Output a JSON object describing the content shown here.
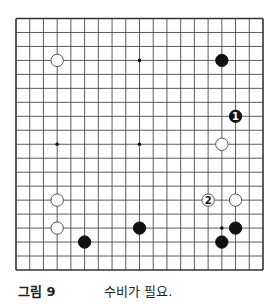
{
  "diagram": {
    "type": "go-board",
    "size": 19,
    "colors": {
      "line": "#333333",
      "black": "#111111",
      "white": "#ffffff",
      "background": "#ffffff"
    },
    "star_points": [
      [
        3,
        3
      ],
      [
        9,
        3
      ],
      [
        15,
        3
      ],
      [
        3,
        9
      ],
      [
        9,
        9
      ],
      [
        15,
        9
      ],
      [
        3,
        15
      ],
      [
        9,
        15
      ],
      [
        15,
        15
      ]
    ],
    "stones": [
      {
        "col": 3,
        "row": 3,
        "color": "white",
        "label": ""
      },
      {
        "col": 15,
        "row": 3,
        "color": "black",
        "label": ""
      },
      {
        "col": 16,
        "row": 7,
        "color": "black",
        "label": "1"
      },
      {
        "col": 15,
        "row": 9,
        "color": "white",
        "label": ""
      },
      {
        "col": 14,
        "row": 13,
        "color": "white",
        "label": "2"
      },
      {
        "col": 16,
        "row": 13,
        "color": "white",
        "label": ""
      },
      {
        "col": 3,
        "row": 13,
        "color": "white",
        "label": ""
      },
      {
        "col": 3,
        "row": 15,
        "color": "white",
        "label": ""
      },
      {
        "col": 9,
        "row": 15,
        "color": "black",
        "label": ""
      },
      {
        "col": 16,
        "row": 15,
        "color": "black",
        "label": ""
      },
      {
        "col": 15,
        "row": 16,
        "color": "black",
        "label": ""
      },
      {
        "col": 5,
        "row": 16,
        "color": "black",
        "label": ""
      }
    ]
  },
  "caption": {
    "figure_label": "그림 9",
    "description": "수비가 필요."
  }
}
